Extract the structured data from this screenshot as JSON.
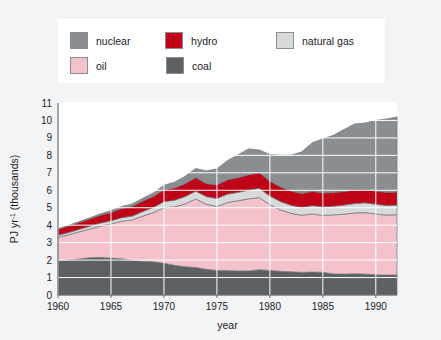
{
  "figure": {
    "background_color": "#f3f4f6",
    "plot_background": "#ffffff"
  },
  "legend": {
    "items": [
      {
        "label": "nuclear",
        "color": "#8b8e90",
        "swatch_name": "legend-swatch-nuclear"
      },
      {
        "label": "hydro",
        "color": "#c00418",
        "swatch_name": "legend-swatch-hydro"
      },
      {
        "label": "natural gas",
        "color": "#d9dadb",
        "swatch_name": "legend-swatch-natural-gas"
      },
      {
        "label": "oil",
        "color": "#f4c2cb",
        "swatch_name": "legend-swatch-oil"
      },
      {
        "label": "coal",
        "color": "#5d6164",
        "swatch_name": "legend-swatch-coal"
      }
    ]
  },
  "chart_data": {
    "type": "area",
    "title": "",
    "xlabel": "year",
    "ylabel": "PJ yr-1 (thousands)",
    "ylabel_base": "PJ yr",
    "ylabel_sup": "-1",
    "ylabel_tail": " (thousands)",
    "xlim": [
      1960,
      1992
    ],
    "ylim": [
      0,
      11
    ],
    "grid": true,
    "grid_color": "#ffffff",
    "legend_position": "top",
    "stacked": true,
    "stack_order_bottom_to_top": [
      "coal",
      "oil",
      "natural gas",
      "hydro",
      "nuclear"
    ],
    "yticks": [
      0,
      1,
      2,
      3,
      4,
      5,
      6,
      7,
      8,
      9,
      10,
      11
    ],
    "ytick_labels": [
      "0",
      "1",
      "2",
      "3",
      "4",
      "5",
      "6",
      "7",
      "8",
      "9",
      "10",
      "11"
    ],
    "xticks": [
      1960,
      1965,
      1970,
      1975,
      1980,
      1985,
      1990
    ],
    "xtick_labels": [
      "1960",
      "1965",
      "1970",
      "1975",
      "1980",
      "1985",
      "1990"
    ],
    "x": [
      1960,
      1961,
      1962,
      1963,
      1964,
      1965,
      1966,
      1967,
      1968,
      1969,
      1970,
      1971,
      1972,
      1973,
      1974,
      1975,
      1976,
      1977,
      1978,
      1979,
      1980,
      1981,
      1982,
      1983,
      1984,
      1985,
      1986,
      1987,
      1988,
      1989,
      1990,
      1991,
      1992
    ],
    "series": [
      {
        "name": "coal",
        "color": "#5d6164",
        "values": [
          1.95,
          2.0,
          2.06,
          2.14,
          2.15,
          2.12,
          2.08,
          1.98,
          1.94,
          1.9,
          1.82,
          1.7,
          1.62,
          1.58,
          1.47,
          1.41,
          1.4,
          1.38,
          1.38,
          1.45,
          1.41,
          1.36,
          1.33,
          1.3,
          1.32,
          1.3,
          1.21,
          1.2,
          1.22,
          1.2,
          1.16,
          1.14,
          1.15
        ]
      },
      {
        "name": "oil",
        "color": "#f4c2cb",
        "values": [
          1.35,
          1.45,
          1.56,
          1.64,
          1.8,
          1.95,
          2.15,
          2.32,
          2.58,
          2.82,
          3.18,
          3.35,
          3.6,
          3.92,
          3.73,
          3.66,
          3.9,
          4.02,
          4.13,
          4.13,
          3.76,
          3.52,
          3.35,
          3.27,
          3.32,
          3.26,
          3.38,
          3.43,
          3.48,
          3.52,
          3.48,
          3.44,
          3.45
        ]
      },
      {
        "name": "natural gas",
        "color": "#d9dadb",
        "values": [
          0.12,
          0.13,
          0.14,
          0.16,
          0.17,
          0.18,
          0.2,
          0.22,
          0.26,
          0.3,
          0.35,
          0.38,
          0.42,
          0.45,
          0.44,
          0.46,
          0.48,
          0.48,
          0.5,
          0.53,
          0.5,
          0.47,
          0.46,
          0.45,
          0.48,
          0.49,
          0.5,
          0.52,
          0.54,
          0.56,
          0.56,
          0.55,
          0.55
        ]
      },
      {
        "name": "hydro",
        "color": "#c00418",
        "values": [
          0.35,
          0.37,
          0.4,
          0.42,
          0.45,
          0.48,
          0.52,
          0.56,
          0.6,
          0.63,
          0.68,
          0.7,
          0.74,
          0.78,
          0.75,
          0.78,
          0.82,
          0.84,
          0.88,
          0.9,
          0.86,
          0.84,
          0.82,
          0.8,
          0.82,
          0.8,
          0.78,
          0.78,
          0.78,
          0.76,
          0.76,
          0.75,
          0.75
        ]
      },
      {
        "name": "nuclear",
        "color": "#8b8e90",
        "values": [
          0.03,
          0.04,
          0.05,
          0.06,
          0.08,
          0.1,
          0.12,
          0.14,
          0.16,
          0.2,
          0.26,
          0.33,
          0.42,
          0.52,
          0.72,
          0.92,
          1.1,
          1.32,
          1.48,
          1.3,
          1.52,
          1.82,
          2.05,
          2.38,
          2.78,
          3.1,
          3.28,
          3.55,
          3.78,
          3.82,
          4.04,
          4.2,
          4.3
        ]
      }
    ]
  }
}
